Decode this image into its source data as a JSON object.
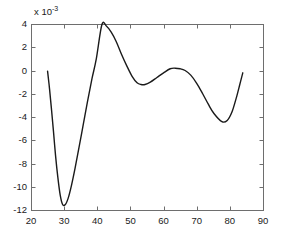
{
  "figure": {
    "background_color": "#ffffff",
    "axis_color": "#6e6e6e",
    "curve_color": "#1a1a1a",
    "exponent_label": "x 10",
    "exponent_value": "-3"
  },
  "chart_data": {
    "type": "line",
    "title": "",
    "xlabel": "",
    "ylabel": "",
    "xlim": [
      20,
      90
    ],
    "ylim": [
      -12,
      4
    ],
    "y_scale_note": "values in units of 1e-3 (axis multiplier x 10^-3)",
    "grid": false,
    "legend": null,
    "xticks": [
      20,
      30,
      40,
      50,
      60,
      70,
      80,
      90
    ],
    "xticklabels": [
      "20",
      "30",
      "40",
      "50",
      "60",
      "70",
      "80",
      "90"
    ],
    "yticks": [
      4,
      2,
      0,
      -2,
      -4,
      -6,
      -8,
      -10,
      -12
    ],
    "yticklabels": [
      "4",
      "2",
      "0",
      "-2",
      "-4",
      "-6",
      "-8",
      "-10",
      "-12"
    ],
    "series": [
      {
        "name": "curve",
        "color": "#1a1a1a",
        "linewidth": 1.4,
        "x": [
          25.0,
          25.6,
          26.2,
          26.8,
          27.4,
          28.1,
          28.8,
          29.5,
          30.3,
          31.2,
          32.2,
          33.3,
          34.5,
          35.8,
          37.1,
          38.4,
          39.7,
          41.4,
          42.8,
          44.2,
          45.7,
          47.3,
          48.9,
          50.5,
          52.0,
          53.2,
          54.4,
          56.0,
          58.0,
          60.0,
          62.0,
          63.5,
          65.0,
          66.5,
          68.2,
          70.0,
          71.8,
          73.5,
          75.2,
          77.6,
          79.2,
          80.6,
          81.9,
          83.0,
          83.9
        ],
        "y": [
          -0.05,
          -1.6,
          -3.4,
          -5.3,
          -7.3,
          -9.2,
          -10.7,
          -11.5,
          -11.55,
          -11.0,
          -9.9,
          -8.4,
          -6.6,
          -4.6,
          -2.6,
          -0.7,
          1.0,
          3.95,
          3.8,
          3.3,
          2.5,
          1.4,
          0.4,
          -0.5,
          -1.05,
          -1.2,
          -1.2,
          -1.0,
          -0.6,
          -0.2,
          0.15,
          0.2,
          0.15,
          0.0,
          -0.4,
          -1.1,
          -2.0,
          -2.9,
          -3.7,
          -4.4,
          -4.3,
          -3.6,
          -2.4,
          -1.2,
          -0.2
        ],
        "annotations": [
          {
            "label": "global minimum",
            "x": 28.8,
            "y": -11.55
          },
          {
            "label": "global maximum",
            "x": 41.4,
            "y": 4.0
          },
          {
            "label": "local minimum",
            "x": 54.0,
            "y": -1.2
          },
          {
            "label": "local maximum",
            "x": 63.5,
            "y": 0.2
          },
          {
            "label": "second minimum",
            "x": 77.6,
            "y": -4.4
          }
        ]
      }
    ]
  },
  "axes": {
    "box": {
      "left": 31,
      "top": 24,
      "right": 263,
      "bottom": 210
    }
  }
}
